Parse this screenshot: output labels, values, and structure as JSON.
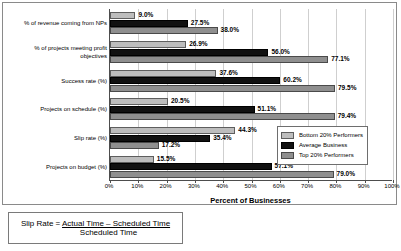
{
  "chart_data": {
    "type": "bar",
    "orientation": "horizontal",
    "title": "",
    "xlabel": "Percent of Businesses",
    "ylabel": "",
    "xlim": [
      0,
      100
    ],
    "xtick_values": [
      0,
      10,
      20,
      30,
      40,
      50,
      60,
      70,
      80,
      90,
      100
    ],
    "xtick_labels": [
      "0%",
      "10%",
      "20%",
      "30%",
      "40%",
      "50%",
      "60%",
      "70%",
      "80%",
      "90%",
      "100%"
    ],
    "grid": true,
    "legend_position": "inside-right-lower",
    "categories": [
      "% of revenue coming from NPs",
      "% of projects meeting profit objectives",
      "Success rate (%)",
      "Projects on schedule (%)",
      "Slip rate (%)",
      "Projects on budget (%)"
    ],
    "series": [
      {
        "name": "Bottom 20% Performers",
        "color": "#bdbdbd",
        "values": [
          9.0,
          26.9,
          37.6,
          20.5,
          44.3,
          15.5
        ],
        "labels": [
          "9.0%",
          "26.9%",
          "37.6%",
          "20.5%",
          "44.3%",
          "15.5%"
        ]
      },
      {
        "name": "Average Business",
        "color": "#111111",
        "values": [
          27.5,
          56.0,
          60.2,
          51.1,
          35.4,
          57.1
        ],
        "labels": [
          "27.5%",
          "56.0%",
          "60.2%",
          "51.1%",
          "35.4%",
          "57.1%"
        ]
      },
      {
        "name": "Top 20% Performers",
        "color": "#8f8f8f",
        "values": [
          38.0,
          77.1,
          79.5,
          79.4,
          17.2,
          79.0
        ],
        "labels": [
          "38.0%",
          "77.1%",
          "79.5%",
          "79.4%",
          "17.2%",
          "79.0%"
        ]
      }
    ]
  },
  "footnote": {
    "lead": "Slip Rate = ",
    "numerator": "Actual Time – Scheduled Time",
    "denominator": "Scheduled Time"
  }
}
